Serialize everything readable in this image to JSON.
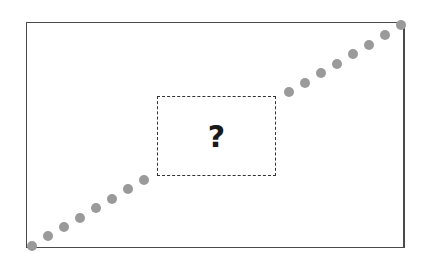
{
  "diagram": {
    "frame": {
      "left": 26,
      "top": 22,
      "width": 379,
      "height": 226
    },
    "hidden_region": {
      "label": "?",
      "left": 157,
      "top": 96,
      "width": 119,
      "height": 80
    },
    "dot_color": "#9a9a9a",
    "dots_lower": [
      [
        32,
        246
      ],
      [
        48,
        236
      ],
      [
        64,
        227
      ],
      [
        80,
        218
      ],
      [
        96,
        208
      ],
      [
        112,
        199
      ],
      [
        128,
        189
      ],
      [
        144,
        180
      ]
    ],
    "dots_upper": [
      [
        289,
        92
      ],
      [
        305,
        83
      ],
      [
        321,
        73
      ],
      [
        337,
        64
      ],
      [
        353,
        54
      ],
      [
        369,
        45
      ],
      [
        385,
        35
      ],
      [
        401,
        25
      ]
    ]
  }
}
